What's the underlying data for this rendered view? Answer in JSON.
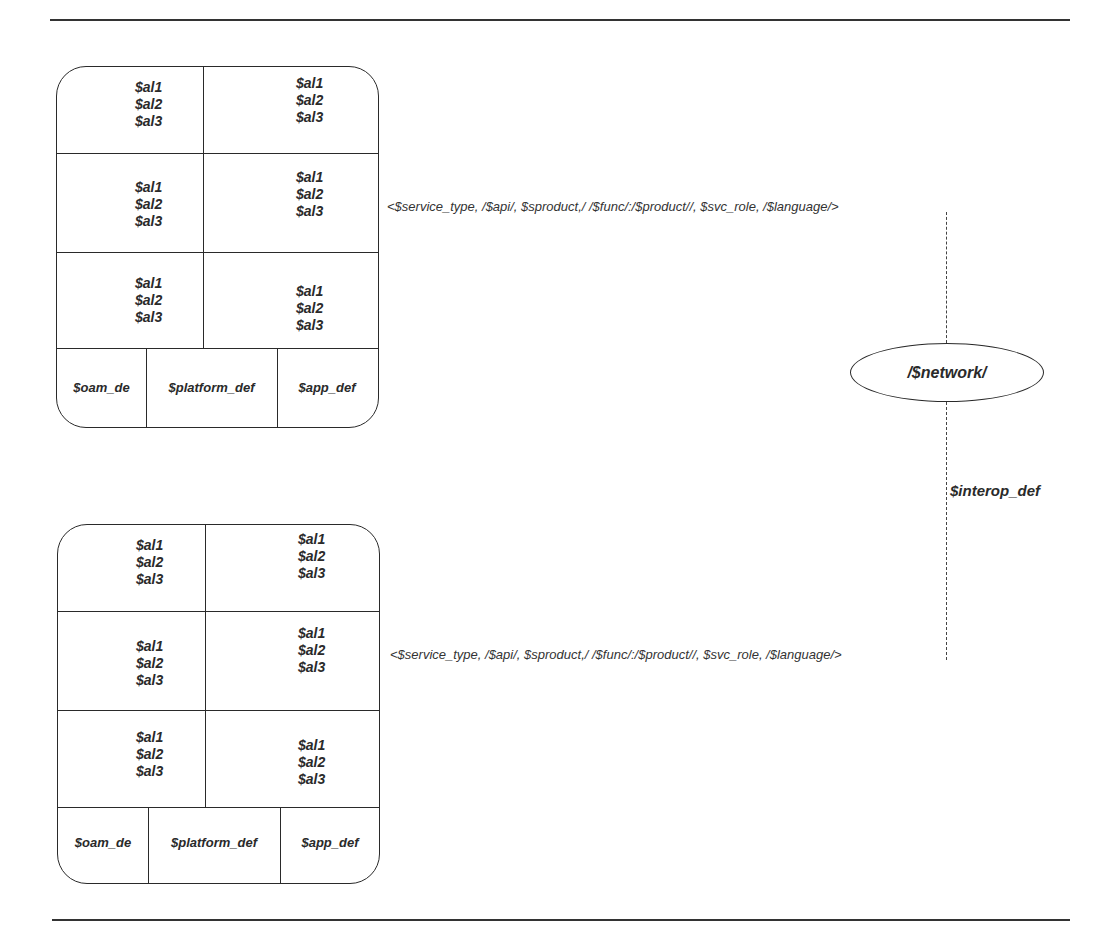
{
  "diagram": {
    "attr_lines": [
      "$al1",
      "$al2",
      "$al3"
    ],
    "top_box": {
      "cells": [
        [
          "$al1",
          "$al2",
          "$al3"
        ],
        [
          "$al1",
          "$al2",
          "$al3"
        ],
        [
          "$al1",
          "$al2",
          "$al3"
        ],
        [
          "$al1",
          "$al2",
          "$al3"
        ],
        [
          "$al1",
          "$al2",
          "$al3"
        ],
        [
          "$al1",
          "$al2",
          "$al3"
        ]
      ],
      "footer": [
        "$oam_de",
        "$platform_def",
        "$app_def"
      ]
    },
    "bottom_box": {
      "cells": [
        [
          "$al1",
          "$al2",
          "$al3"
        ],
        [
          "$al1",
          "$al2",
          "$al3"
        ],
        [
          "$al1",
          "$al2",
          "$al3"
        ],
        [
          "$al1",
          "$al2",
          "$al3"
        ],
        [
          "$al1",
          "$al2",
          "$al3"
        ],
        [
          "$al1",
          "$al2",
          "$al3"
        ]
      ],
      "footer": [
        "$oam_de",
        "$platform_def",
        "$app_def"
      ]
    },
    "top_tuple": "<$service_type, /$api/, $sproduct,/ /$func/:/$product//, $svc_role, /$language/>",
    "bottom_tuple": "<$service_type, /$api/, $sproduct,/ /$func/:/$product//, $svc_role, /$language/>",
    "network_node": "/$network/",
    "interop_label": "$interop_def"
  }
}
